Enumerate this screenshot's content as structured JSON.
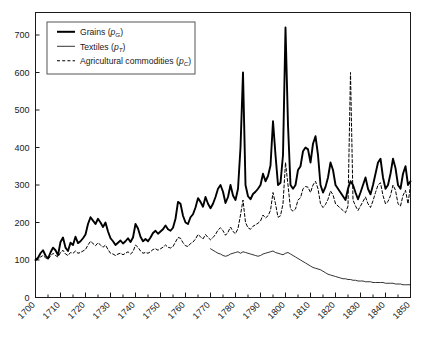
{
  "chart_data": {
    "type": "line",
    "title": "",
    "subtitle": "",
    "xlabel": "",
    "ylabel": "",
    "xlim": [
      1700,
      1850
    ],
    "ylim": [
      0,
      760
    ],
    "yticks": [
      0,
      100,
      200,
      300,
      400,
      500,
      600,
      700
    ],
    "ytick_labels": [
      "0",
      "100",
      "200",
      "300",
      "400",
      "500",
      "600",
      "700"
    ],
    "xticks": [
      1700,
      1710,
      1720,
      1730,
      1740,
      1750,
      1760,
      1770,
      1780,
      1790,
      1800,
      1810,
      1820,
      1830,
      1840,
      1850
    ],
    "xtick_labels": [
      "1700",
      "1710",
      "1720",
      "1730",
      "1740",
      "1750",
      "1760",
      "1770",
      "1780",
      "1790",
      "1800",
      "1810",
      "1820",
      "1830",
      "1840",
      "1850"
    ],
    "minor_xtick_interval": 5,
    "grid": false,
    "legend_position": "top-left",
    "series": [
      {
        "name": "Grains",
        "symbol": "p",
        "subscript": "G",
        "style": "solid",
        "width": 1.9,
        "color": "#000000",
        "x_start": 1700,
        "x": [
          1700,
          1701,
          1702,
          1703,
          1704,
          1705,
          1706,
          1707,
          1708,
          1709,
          1710,
          1711,
          1712,
          1713,
          1714,
          1715,
          1716,
          1717,
          1718,
          1719,
          1720,
          1721,
          1722,
          1723,
          1724,
          1725,
          1726,
          1727,
          1728,
          1729,
          1730,
          1731,
          1732,
          1733,
          1734,
          1735,
          1736,
          1737,
          1738,
          1739,
          1740,
          1741,
          1742,
          1743,
          1744,
          1745,
          1746,
          1747,
          1748,
          1749,
          1750,
          1751,
          1752,
          1753,
          1754,
          1755,
          1756,
          1757,
          1758,
          1759,
          1760,
          1761,
          1762,
          1763,
          1764,
          1765,
          1766,
          1767,
          1768,
          1769,
          1770,
          1771,
          1772,
          1773,
          1774,
          1775,
          1776,
          1777,
          1778,
          1779,
          1780,
          1781,
          1782,
          1783,
          1784,
          1785,
          1786,
          1787,
          1788,
          1789,
          1790,
          1791,
          1792,
          1793,
          1794,
          1795,
          1796,
          1797,
          1798,
          1799,
          1800,
          1801,
          1802,
          1803,
          1804,
          1805,
          1806,
          1807,
          1808,
          1809,
          1810,
          1811,
          1812,
          1813,
          1814,
          1815,
          1816,
          1817,
          1818,
          1819,
          1820,
          1821,
          1822,
          1823,
          1824,
          1825,
          1826,
          1827,
          1828,
          1829,
          1830,
          1831,
          1832,
          1833,
          1834,
          1835,
          1836,
          1837,
          1838,
          1839,
          1840,
          1841,
          1842,
          1843,
          1844,
          1845,
          1846,
          1847,
          1848,
          1849,
          1850
        ],
        "values": [
          100,
          106,
          118,
          126,
          112,
          104,
          120,
          133,
          126,
          113,
          148,
          160,
          133,
          124,
          146,
          140,
          162,
          145,
          150,
          158,
          168,
          196,
          214,
          205,
          196,
          210,
          200,
          188,
          200,
          176,
          158,
          150,
          140,
          146,
          152,
          144,
          150,
          158,
          148,
          160,
          196,
          184,
          162,
          150,
          156,
          150,
          160,
          172,
          178,
          170,
          176,
          182,
          192,
          182,
          178,
          186,
          210,
          255,
          250,
          218,
          200,
          196,
          214,
          222,
          240,
          265,
          255,
          242,
          268,
          250,
          238,
          250,
          268,
          290,
          300,
          282,
          252,
          268,
          300,
          272,
          260,
          290,
          400,
          600,
          300,
          270,
          262,
          276,
          282,
          290,
          300,
          330,
          310,
          324,
          352,
          470,
          380,
          300,
          306,
          380,
          720,
          460,
          300,
          290,
          300,
          340,
          350,
          390,
          400,
          395,
          360,
          410,
          430,
          380,
          300,
          280,
          295,
          320,
          360,
          340,
          300,
          290,
          280,
          270,
          260,
          290,
          310,
          300,
          280,
          262,
          280,
          300,
          320,
          290,
          275,
          300,
          330,
          360,
          370,
          320,
          290,
          300,
          330,
          370,
          345,
          300,
          290,
          330,
          350,
          300,
          310
        ]
      },
      {
        "name": "Textiles",
        "symbol": "p",
        "subscript": "T",
        "style": "solid",
        "width": 0.8,
        "color": "#000000",
        "x_start": 1770,
        "x": [
          1770,
          1771,
          1772,
          1773,
          1774,
          1775,
          1776,
          1777,
          1778,
          1779,
          1780,
          1781,
          1782,
          1783,
          1784,
          1785,
          1786,
          1787,
          1788,
          1789,
          1790,
          1791,
          1792,
          1793,
          1794,
          1795,
          1796,
          1797,
          1798,
          1799,
          1800,
          1801,
          1802,
          1803,
          1804,
          1805,
          1806,
          1807,
          1808,
          1809,
          1810,
          1811,
          1812,
          1813,
          1814,
          1815,
          1816,
          1817,
          1818,
          1819,
          1820,
          1821,
          1822,
          1823,
          1824,
          1825,
          1826,
          1827,
          1828,
          1829,
          1830,
          1831,
          1832,
          1833,
          1834,
          1835,
          1836,
          1837,
          1838,
          1839,
          1840,
          1841,
          1842,
          1843,
          1844,
          1845,
          1846,
          1847,
          1848,
          1849,
          1850
        ],
        "values": [
          130,
          126,
          122,
          118,
          116,
          112,
          110,
          112,
          116,
          118,
          120,
          122,
          118,
          122,
          120,
          118,
          116,
          114,
          112,
          110,
          112,
          116,
          118,
          120,
          122,
          124,
          120,
          118,
          116,
          114,
          118,
          120,
          116,
          112,
          108,
          104,
          100,
          96,
          92,
          88,
          84,
          80,
          78,
          76,
          74,
          70,
          66,
          62,
          60,
          58,
          56,
          54,
          52,
          50,
          50,
          48,
          48,
          46,
          46,
          44,
          44,
          44,
          42,
          42,
          42,
          40,
          40,
          40,
          40,
          40,
          38,
          38,
          38,
          38,
          36,
          36,
          36,
          34,
          34,
          34,
          34
        ]
      },
      {
        "name": "Agricultural commodities",
        "symbol": "p",
        "subscript": "C",
        "style": "dashed",
        "width": 1.0,
        "color": "#000000",
        "x_start": 1700,
        "x": [
          1700,
          1701,
          1702,
          1703,
          1704,
          1705,
          1706,
          1707,
          1708,
          1709,
          1710,
          1711,
          1712,
          1713,
          1714,
          1715,
          1716,
          1717,
          1718,
          1719,
          1720,
          1721,
          1722,
          1723,
          1724,
          1725,
          1726,
          1727,
          1728,
          1729,
          1730,
          1731,
          1732,
          1733,
          1734,
          1735,
          1736,
          1737,
          1738,
          1739,
          1740,
          1741,
          1742,
          1743,
          1744,
          1745,
          1746,
          1747,
          1748,
          1749,
          1750,
          1751,
          1752,
          1753,
          1754,
          1755,
          1756,
          1757,
          1758,
          1759,
          1760,
          1761,
          1762,
          1763,
          1764,
          1765,
          1766,
          1767,
          1768,
          1769,
          1770,
          1771,
          1772,
          1773,
          1774,
          1775,
          1776,
          1777,
          1778,
          1779,
          1780,
          1781,
          1782,
          1783,
          1784,
          1785,
          1786,
          1787,
          1788,
          1789,
          1790,
          1791,
          1792,
          1793,
          1794,
          1795,
          1796,
          1797,
          1798,
          1799,
          1800,
          1801,
          1802,
          1803,
          1804,
          1805,
          1806,
          1807,
          1808,
          1809,
          1810,
          1811,
          1812,
          1813,
          1814,
          1815,
          1816,
          1817,
          1818,
          1819,
          1820,
          1821,
          1822,
          1823,
          1824,
          1825,
          1826,
          1827,
          1828,
          1829,
          1830,
          1831,
          1832,
          1833,
          1834,
          1835,
          1836,
          1837,
          1838,
          1839,
          1840,
          1841,
          1842,
          1843,
          1844,
          1845,
          1846,
          1847,
          1848,
          1849,
          1850
        ],
        "values": [
          100,
          102,
          108,
          112,
          106,
          102,
          110,
          118,
          112,
          108,
          120,
          126,
          116,
          112,
          120,
          118,
          124,
          118,
          120,
          124,
          128,
          140,
          150,
          144,
          138,
          146,
          140,
          134,
          140,
          128,
          118,
          116,
          112,
          116,
          118,
          114,
          118,
          122,
          116,
          122,
          140,
          134,
          124,
          118,
          120,
          118,
          122,
          128,
          130,
          126,
          130,
          134,
          140,
          134,
          132,
          136,
          148,
          160,
          158,
          146,
          138,
          136,
          144,
          148,
          156,
          168,
          162,
          156,
          168,
          160,
          154,
          160,
          168,
          180,
          186,
          178,
          166,
          174,
          188,
          176,
          170,
          184,
          220,
          260,
          200,
          186,
          182,
          190,
          194,
          198,
          204,
          220,
          212,
          218,
          232,
          280,
          250,
          214,
          218,
          250,
          360,
          300,
          236,
          230,
          236,
          260,
          266,
          290,
          296,
          294,
          280,
          300,
          310,
          290,
          250,
          240,
          248,
          262,
          284,
          274,
          250,
          244,
          238,
          232,
          226,
          244,
          600,
          260,
          244,
          232,
          244,
          256,
          268,
          250,
          240,
          258,
          280,
          300,
          306,
          272,
          250,
          256,
          272,
          300,
          286,
          250,
          244,
          272,
          286,
          250,
          300
        ]
      }
    ]
  },
  "legend": {
    "items": [
      {
        "name": "Grains",
        "paren_open": "(",
        "symbol": "p",
        "subscript": "G",
        "paren_close": ")",
        "line_style": "thick-solid"
      },
      {
        "name": "Textiles",
        "paren_open": "(",
        "symbol": "p",
        "subscript": "T",
        "paren_close": ")",
        "line_style": "thin-solid"
      },
      {
        "name": "Agricultural commodities",
        "paren_open": "(",
        "symbol": "p",
        "subscript": "C",
        "paren_close": ")",
        "line_style": "dashed"
      }
    ]
  },
  "colors": {
    "axis": "#1a1a1a",
    "series": "#000000",
    "background": "#ffffff",
    "legend_border": "#555555"
  }
}
